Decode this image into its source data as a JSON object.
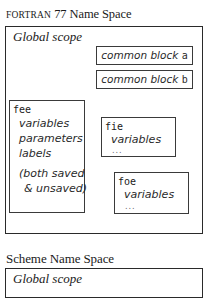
{
  "fortran": {
    "title_smallcaps": "FORTRAN",
    "title_rest": " 77 Name Space",
    "global_scope_label": "Global scope",
    "common_blocks": [
      {
        "prefix": "common block ",
        "name": "a"
      },
      {
        "prefix": "common block ",
        "name": "b"
      }
    ],
    "procedures": [
      {
        "name": "fee",
        "items": [
          "variables",
          "parameters",
          "labels"
        ],
        "note_lines": [
          "(both saved",
          "& unsaved)"
        ]
      },
      {
        "name": "fie",
        "items": [
          "variables"
        ],
        "ellipsis": "..."
      },
      {
        "name": "foe",
        "items": [
          "variables"
        ],
        "ellipsis": "..."
      }
    ]
  },
  "scheme": {
    "title": "Scheme Name Space",
    "global_scope_label": "Global scope"
  }
}
